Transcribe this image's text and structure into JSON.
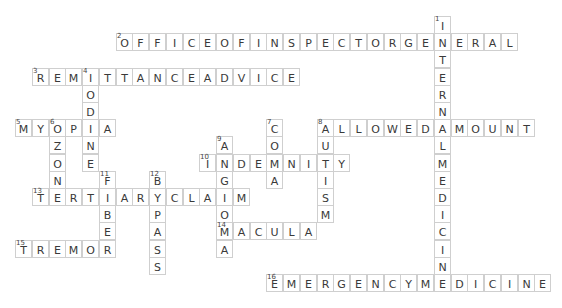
{
  "puzzle": {
    "grid_origin": {
      "x": 15,
      "y": 16
    },
    "cell_pitch": {
      "x": 16.75,
      "y": 17.2
    },
    "colors": {
      "border": "#cfcfcf",
      "letter": "#3a3a3a",
      "background": "#ffffff"
    },
    "words": [
      {
        "number": "1",
        "direction": "down",
        "answer": "INTERNALMEDICINE",
        "row": 0,
        "col": 25
      },
      {
        "number": "2",
        "direction": "across",
        "answer": "OFFICEOFINSPECTORGENERAL",
        "row": 1,
        "col": 6
      },
      {
        "number": "3",
        "direction": "across",
        "answer": "REMITTANCEADVICE",
        "row": 3,
        "col": 1
      },
      {
        "number": "4",
        "direction": "down",
        "answer": "IODINE",
        "row": 3,
        "col": 4
      },
      {
        "number": "5",
        "direction": "across",
        "answer": "MYOPIA",
        "row": 6,
        "col": 0
      },
      {
        "number": "6",
        "direction": "down",
        "answer": "OZONE",
        "row": 6,
        "col": 2
      },
      {
        "number": "7",
        "direction": "down",
        "answer": "COMA",
        "row": 6,
        "col": 15
      },
      {
        "number": "8",
        "direction": "across",
        "answer": "ALLOWEDAMOUNT",
        "row": 6,
        "col": 18
      },
      {
        "number": "8",
        "direction": "down",
        "answer": "AUTISM",
        "row": 6,
        "col": 18
      },
      {
        "number": "9",
        "direction": "down",
        "answer": "ANGIOMA",
        "row": 7,
        "col": 12
      },
      {
        "number": "10",
        "direction": "across",
        "answer": "INDEMNITY",
        "row": 8,
        "col": 11
      },
      {
        "number": "11",
        "direction": "down",
        "answer": "FIBER",
        "row": 9,
        "col": 5
      },
      {
        "number": "12",
        "direction": "down",
        "answer": "BYPASS",
        "row": 9,
        "col": 8
      },
      {
        "number": "13",
        "direction": "across",
        "answer": "TERTIARYCLAIM",
        "row": 10,
        "col": 1
      },
      {
        "number": "14",
        "direction": "across",
        "answer": "MACULA",
        "row": 12,
        "col": 12
      },
      {
        "number": "15",
        "direction": "across",
        "answer": "TREMOR",
        "row": 13,
        "col": 0
      },
      {
        "number": "16",
        "direction": "across",
        "answer": "EMERGENCYMEDICINE",
        "row": 15,
        "col": 15
      }
    ]
  }
}
